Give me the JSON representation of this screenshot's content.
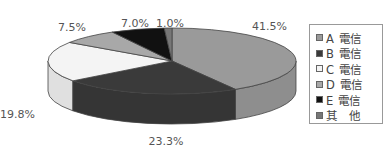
{
  "chart_data": {
    "type": "pie",
    "style": "3d",
    "title": "",
    "categories": [
      "A 電信",
      "B 電信",
      "C 電信",
      "D 電信",
      "E 電信",
      "其　他"
    ],
    "values": [
      41.5,
      23.3,
      19.8,
      7.5,
      7.0,
      1.0
    ],
    "data_labels": [
      "41.5%",
      "23.3%",
      "19.8%",
      "7.5%",
      "7.0%",
      "1.0%"
    ],
    "colors": [
      "#9a9a9a",
      "#3a3a3a",
      "#f4f4f4",
      "#a8a8a8",
      "#111111",
      "#777777"
    ],
    "legend_position": "right"
  }
}
